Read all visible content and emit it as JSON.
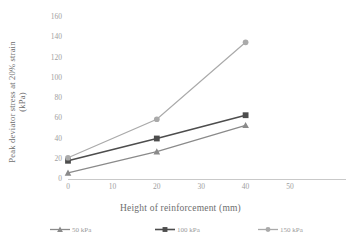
{
  "chart_data": {
    "type": "line",
    "title": "",
    "xlabel": "Height of reinforcement (mm)",
    "ylabel": "Peak deviator stress at  20% strain (kPa)",
    "ylabel_line1": "Peak deviator stress at  20% strain",
    "ylabel_line2": "(kPa)",
    "x": [
      0,
      20,
      40
    ],
    "xlim": [
      0,
      50
    ],
    "ylim": [
      0,
      160
    ],
    "xticks": [
      0,
      10,
      20,
      30,
      40,
      50
    ],
    "yticks": [
      0,
      20,
      40,
      60,
      80,
      100,
      120,
      140,
      160
    ],
    "xticklabels": [
      "0",
      "10",
      "20",
      "30",
      "40",
      "50"
    ],
    "yticklabels": [
      "0",
      "20",
      "40",
      "60",
      "80",
      "100",
      "120",
      "140",
      "160"
    ],
    "grid": false,
    "legend_position": "bottom",
    "series": [
      {
        "name": "50 kPa",
        "label": "50 kPa",
        "marker": "triangle",
        "color": "#8a8a8a",
        "x": [
          0,
          20,
          40
        ],
        "values": [
          6,
          27,
          53
        ]
      },
      {
        "name": "100 kPa",
        "label": "100 kPa",
        "marker": "square",
        "color": "#4d4d4d",
        "x": [
          0,
          20,
          40
        ],
        "values": [
          18,
          40,
          63
        ]
      },
      {
        "name": "150 kPa",
        "label": "150 kPa",
        "marker": "circle",
        "color": "#aaaaaa",
        "x": [
          0,
          20,
          40
        ],
        "values": [
          21,
          59,
          135
        ]
      }
    ]
  },
  "colors": {
    "axis": "#c9c9c9",
    "tick_text": "#a0a0a0",
    "title_text": "#6e6e6e",
    "background": "#ffffff",
    "series_50": "#8a8a8a",
    "series_100": "#4d4d4d",
    "series_150": "#aaaaaa"
  }
}
